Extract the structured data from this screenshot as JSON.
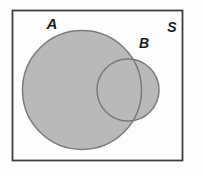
{
  "diagram": {
    "type": "venn",
    "universal_set_label": "S",
    "set_a_label": "A",
    "set_b_label": "B",
    "shaded_region": "A ∪ B"
  },
  "colors": {
    "background": "#fdfdfd",
    "region_fill": "#b9b9b9",
    "circle_outline": "#7b7b7b",
    "frame_border": "#3f3f3f",
    "label_text": "#1c1c1c"
  }
}
